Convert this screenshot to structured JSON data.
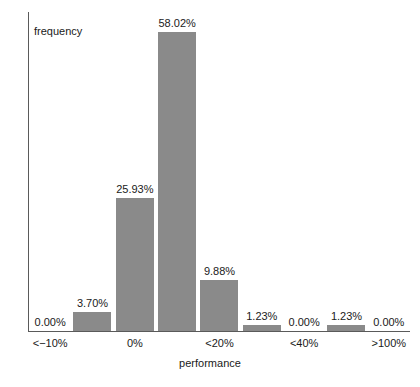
{
  "chart_data": {
    "type": "bar",
    "title": "",
    "xlabel": "performance",
    "ylabel": "frequency",
    "grid": false,
    "legend": "none",
    "ylim": [
      0,
      62
    ],
    "bar_color": "#8a8a8a",
    "axis_color": "#5a5a5a",
    "categories": [
      "<-10%",
      "",
      "0%",
      "",
      "<20%",
      "",
      "<40%",
      "",
      ">100%"
    ],
    "values": [
      0.0,
      3.7,
      25.93,
      58.02,
      9.88,
      1.23,
      0.0,
      1.23,
      0.0
    ],
    "value_labels": [
      "0.00%",
      "3.70%",
      "25.93%",
      "58.02%",
      "9.88%",
      "1.23%",
      "0.00%",
      "1.23%",
      "0.00%"
    ],
    "tick_labels": [
      {
        "text": "<−10%",
        "slot": 0
      },
      {
        "text": "0%",
        "slot": 2
      },
      {
        "text": "<20%",
        "slot": 4
      },
      {
        "text": "<40%",
        "slot": 6
      },
      {
        "text": ">100%",
        "slot": 8
      }
    ]
  }
}
